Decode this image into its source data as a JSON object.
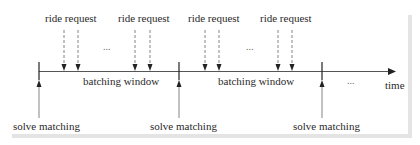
{
  "diagram": {
    "type": "timeline",
    "axis_label": "time",
    "request_label": "ride request",
    "window_label": "batching window",
    "event_label": "solve matching",
    "ellipsis": "...",
    "request_labels": [
      "ride request",
      "ride request",
      "ride request",
      "ride request"
    ],
    "window_labels": [
      "batching window",
      "batching window"
    ],
    "event_labels": [
      "solve matching",
      "solve matching",
      "solve matching"
    ],
    "colors": {
      "line": "#333333",
      "dashed": "#555555",
      "text": "#2a2a2a",
      "shadow": "#e4e4e4"
    }
  }
}
